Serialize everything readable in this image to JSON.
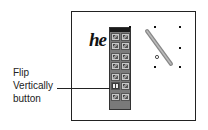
{
  "callout": {
    "lines": [
      "Flip",
      "Vertically",
      "button"
    ],
    "target": "flip-vertically-button"
  },
  "canvas": {
    "text": "he"
  },
  "toolbox": {
    "tools": [
      {
        "name": "selection-tool",
        "icon": "arrow-icon"
      },
      {
        "name": "rectangle-tool",
        "icon": "rectangle-icon"
      },
      {
        "name": "direct-selection-tool",
        "icon": "pointer-icon"
      },
      {
        "name": "zoom-tool",
        "icon": "magnifier-icon"
      },
      {
        "name": "pen-tool",
        "icon": "pen-icon"
      },
      {
        "name": "text-tool",
        "icon": "text-icon"
      },
      {
        "name": "fill-tool",
        "icon": "fill-icon"
      },
      {
        "name": "stroke-tool",
        "icon": "stroke-icon"
      },
      {
        "name": "rotate-tool",
        "icon": "rotate-icon"
      },
      {
        "name": "scale-tool",
        "icon": "scale-icon"
      },
      {
        "name": "flip-vertically-button",
        "icon": "flip-vertical-icon",
        "active": true
      },
      {
        "name": "flip-horizontally-button",
        "icon": "flip-horizontal-icon"
      },
      {
        "name": "align-tool",
        "icon": "align-icon"
      },
      {
        "name": "distribute-tool",
        "icon": "distribute-icon"
      }
    ]
  }
}
